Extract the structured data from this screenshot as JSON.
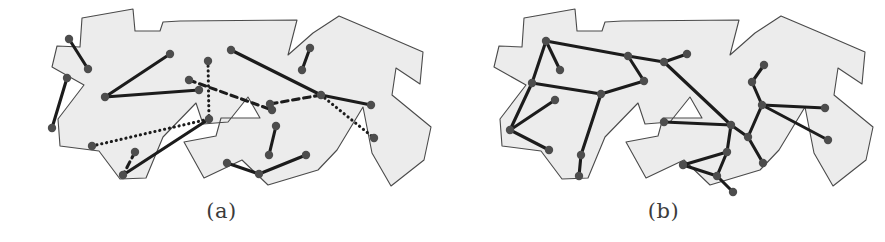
{
  "figure": {
    "type": "two-panel-geometry-figure",
    "background_color": "#ffffff",
    "panel_count": 2
  },
  "style": {
    "polygon_fill": "#ececec",
    "polygon_stroke": "#4a4a4a",
    "polygon_stroke_width": 1.1,
    "point_color": "#4d4d4d",
    "point_radius": 4.2,
    "segment_color": "#1c1c1c",
    "segment_width": 3.1,
    "caption_color": "#3b3b3b"
  },
  "panels": [
    {
      "id": "panel-a",
      "caption": "(a)",
      "description": "Polygon with point set joined by a mix of solid, dotted and dashed segments",
      "polygon": [
        [
          84,
          85
        ],
        [
          52,
          67
        ],
        [
          57,
          46
        ],
        [
          80,
          47
        ],
        [
          82,
          18
        ],
        [
          133,
          9
        ],
        [
          135,
          31
        ],
        [
          160,
          31
        ],
        [
          163,
          22
        ],
        [
          180,
          21
        ],
        [
          297,
          20
        ],
        [
          288,
          55
        ],
        [
          313,
          33
        ],
        [
          339,
          16
        ],
        [
          379,
          33
        ],
        [
          423,
          52
        ],
        [
          420,
          84
        ],
        [
          396,
          68
        ],
        [
          392,
          95
        ],
        [
          431,
          127
        ],
        [
          424,
          160
        ],
        [
          391,
          186
        ],
        [
          372,
          153
        ],
        [
          363,
          107
        ],
        [
          337,
          150
        ],
        [
          318,
          170
        ],
        [
          268,
          185
        ],
        [
          242,
          160
        ],
        [
          204,
          178
        ],
        [
          184,
          142
        ],
        [
          216,
          136
        ],
        [
          221,
          118
        ],
        [
          260,
          118
        ],
        [
          248,
          97
        ],
        [
          228,
          122
        ],
        [
          203,
          124
        ],
        [
          196,
          103
        ],
        [
          163,
          137
        ],
        [
          146,
          178
        ],
        [
          120,
          179
        ],
        [
          99,
          151
        ],
        [
          60,
          146
        ],
        [
          58,
          119
        ],
        [
          84,
          85
        ]
      ],
      "points": [
        {
          "id": "p1",
          "x": 69,
          "y": 39
        },
        {
          "id": "p2",
          "x": 88,
          "y": 69
        },
        {
          "id": "p3",
          "x": 67,
          "y": 78
        },
        {
          "id": "p4",
          "x": 52,
          "y": 128
        },
        {
          "id": "p5",
          "x": 105,
          "y": 97
        },
        {
          "id": "p6",
          "x": 170,
          "y": 54
        },
        {
          "id": "p7",
          "x": 208,
          "y": 61
        },
        {
          "id": "p8",
          "x": 189,
          "y": 80
        },
        {
          "id": "p9",
          "x": 92,
          "y": 146
        },
        {
          "id": "p10",
          "x": 135,
          "y": 152
        },
        {
          "id": "p11",
          "x": 123,
          "y": 175
        },
        {
          "id": "p12",
          "x": 199,
          "y": 90
        },
        {
          "id": "p13",
          "x": 209,
          "y": 119
        },
        {
          "id": "p14",
          "x": 231,
          "y": 50
        },
        {
          "id": "p15",
          "x": 272,
          "y": 110
        },
        {
          "id": "p16",
          "x": 276,
          "y": 126
        },
        {
          "id": "p17",
          "x": 269,
          "y": 155
        },
        {
          "id": "p18",
          "x": 227,
          "y": 163
        },
        {
          "id": "p19",
          "x": 259,
          "y": 174
        },
        {
          "id": "p20",
          "x": 306,
          "y": 155
        },
        {
          "id": "p21",
          "x": 310,
          "y": 48
        },
        {
          "id": "p22",
          "x": 302,
          "y": 70
        },
        {
          "id": "p23",
          "x": 321,
          "y": 95
        },
        {
          "id": "p24",
          "x": 371,
          "y": 105
        },
        {
          "id": "p25",
          "x": 374,
          "y": 138
        },
        {
          "id": "p26",
          "x": 270,
          "y": 104
        }
      ],
      "segments": [
        {
          "from": "p1",
          "to": "p2",
          "style": "solid"
        },
        {
          "from": "p3",
          "to": "p4",
          "style": "solid"
        },
        {
          "from": "p5",
          "to": "p6",
          "style": "solid"
        },
        {
          "from": "p5",
          "to": "p12",
          "style": "solid"
        },
        {
          "from": "p7",
          "to": "p13",
          "style": "dotted"
        },
        {
          "from": "p9",
          "to": "p13",
          "style": "dotted"
        },
        {
          "from": "p8",
          "to": "p15",
          "style": "dashed"
        },
        {
          "from": "p13",
          "to": "p11",
          "style": "solid"
        },
        {
          "from": "p10",
          "to": "p11",
          "style": "dashed"
        },
        {
          "from": "p14",
          "to": "p23",
          "style": "solid"
        },
        {
          "from": "p16",
          "to": "p17",
          "style": "solid"
        },
        {
          "from": "p18",
          "to": "p19",
          "style": "solid"
        },
        {
          "from": "p20",
          "to": "p19",
          "style": "solid"
        },
        {
          "from": "p21",
          "to": "p22",
          "style": "solid"
        },
        {
          "from": "p23",
          "to": "p24",
          "style": "solid"
        },
        {
          "from": "p23",
          "to": "p25",
          "style": "dotted"
        },
        {
          "from": "p23",
          "to": "p26",
          "style": "dashed"
        }
      ]
    },
    {
      "id": "panel-b",
      "caption": "(b)",
      "description": "Same polygon and point set joined into a single connected solid tour",
      "polygon": [
        [
          84,
          85
        ],
        [
          52,
          67
        ],
        [
          57,
          46
        ],
        [
          80,
          47
        ],
        [
          82,
          18
        ],
        [
          133,
          9
        ],
        [
          135,
          31
        ],
        [
          160,
          31
        ],
        [
          163,
          22
        ],
        [
          180,
          21
        ],
        [
          297,
          20
        ],
        [
          288,
          55
        ],
        [
          313,
          33
        ],
        [
          339,
          16
        ],
        [
          379,
          33
        ],
        [
          423,
          52
        ],
        [
          420,
          84
        ],
        [
          396,
          68
        ],
        [
          392,
          95
        ],
        [
          431,
          127
        ],
        [
          424,
          160
        ],
        [
          391,
          186
        ],
        [
          372,
          153
        ],
        [
          363,
          107
        ],
        [
          337,
          150
        ],
        [
          318,
          170
        ],
        [
          268,
          185
        ],
        [
          242,
          160
        ],
        [
          204,
          178
        ],
        [
          184,
          142
        ],
        [
          216,
          136
        ],
        [
          221,
          118
        ],
        [
          260,
          118
        ],
        [
          248,
          97
        ],
        [
          228,
          122
        ],
        [
          203,
          124
        ],
        [
          196,
          103
        ],
        [
          163,
          137
        ],
        [
          146,
          178
        ],
        [
          120,
          179
        ],
        [
          99,
          151
        ],
        [
          60,
          146
        ],
        [
          58,
          119
        ],
        [
          84,
          85
        ]
      ],
      "points": [
        {
          "id": "q1",
          "x": 104,
          "y": 41
        },
        {
          "id": "q2",
          "x": 118,
          "y": 70
        },
        {
          "id": "q3",
          "x": 90,
          "y": 83
        },
        {
          "id": "q4",
          "x": 68,
          "y": 130
        },
        {
          "id": "q5",
          "x": 113,
          "y": 100
        },
        {
          "id": "q6",
          "x": 107,
          "y": 150
        },
        {
          "id": "q7",
          "x": 139,
          "y": 155
        },
        {
          "id": "q8",
          "x": 137,
          "y": 176
        },
        {
          "id": "q9",
          "x": 159,
          "y": 94
        },
        {
          "id": "q10",
          "x": 202,
          "y": 81
        },
        {
          "id": "q11",
          "x": 186,
          "y": 56
        },
        {
          "id": "q12",
          "x": 222,
          "y": 62
        },
        {
          "id": "q13",
          "x": 245,
          "y": 54
        },
        {
          "id": "q14",
          "x": 222,
          "y": 122
        },
        {
          "id": "q15",
          "x": 289,
          "y": 125
        },
        {
          "id": "q16",
          "x": 285,
          "y": 152
        },
        {
          "id": "q17",
          "x": 275,
          "y": 176
        },
        {
          "id": "q18",
          "x": 241,
          "y": 165
        },
        {
          "id": "q19",
          "x": 291,
          "y": 192
        },
        {
          "id": "q20",
          "x": 306,
          "y": 137
        },
        {
          "id": "q21",
          "x": 320,
          "y": 105
        },
        {
          "id": "q22",
          "x": 310,
          "y": 82
        },
        {
          "id": "q23",
          "x": 322,
          "y": 65
        },
        {
          "id": "q24",
          "x": 321,
          "y": 163
        },
        {
          "id": "q25",
          "x": 383,
          "y": 108
        },
        {
          "id": "q26",
          "x": 386,
          "y": 140
        }
      ],
      "segments": [
        {
          "from": "q1",
          "to": "q2",
          "style": "solid"
        },
        {
          "from": "q1",
          "to": "q3",
          "style": "solid"
        },
        {
          "from": "q3",
          "to": "q4",
          "style": "solid"
        },
        {
          "from": "q4",
          "to": "q5",
          "style": "solid"
        },
        {
          "from": "q4",
          "to": "q6",
          "style": "solid"
        },
        {
          "from": "q3",
          "to": "q9",
          "style": "solid"
        },
        {
          "from": "q9",
          "to": "q7",
          "style": "solid"
        },
        {
          "from": "q7",
          "to": "q8",
          "style": "solid"
        },
        {
          "from": "q9",
          "to": "q10",
          "style": "solid"
        },
        {
          "from": "q1",
          "to": "q11",
          "style": "solid"
        },
        {
          "from": "q11",
          "to": "q10",
          "style": "solid"
        },
        {
          "from": "q11",
          "to": "q12",
          "style": "solid"
        },
        {
          "from": "q12",
          "to": "q13",
          "style": "solid"
        },
        {
          "from": "q12",
          "to": "q15",
          "style": "solid"
        },
        {
          "from": "q15",
          "to": "q14",
          "style": "solid"
        },
        {
          "from": "q15",
          "to": "q16",
          "style": "solid"
        },
        {
          "from": "q16",
          "to": "q18",
          "style": "solid"
        },
        {
          "from": "q16",
          "to": "q17",
          "style": "solid"
        },
        {
          "from": "q17",
          "to": "q19",
          "style": "solid"
        },
        {
          "from": "q17",
          "to": "q18",
          "style": "solid"
        },
        {
          "from": "q15",
          "to": "q20",
          "style": "solid"
        },
        {
          "from": "q20",
          "to": "q24",
          "style": "solid"
        },
        {
          "from": "q20",
          "to": "q21",
          "style": "solid"
        },
        {
          "from": "q21",
          "to": "q22",
          "style": "solid"
        },
        {
          "from": "q22",
          "to": "q23",
          "style": "solid"
        },
        {
          "from": "q21",
          "to": "q25",
          "style": "solid"
        },
        {
          "from": "q21",
          "to": "q26",
          "style": "solid"
        }
      ]
    }
  ]
}
